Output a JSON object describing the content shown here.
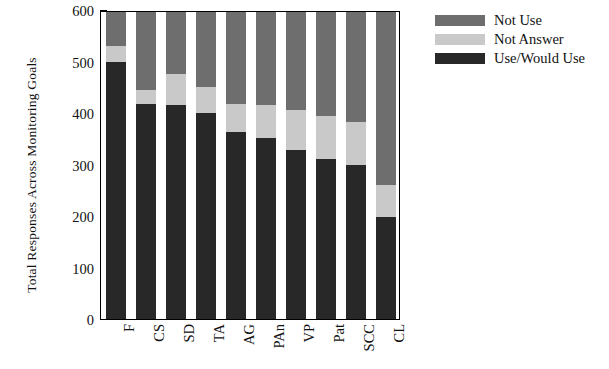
{
  "chart_data": {
    "type": "bar",
    "subtype": "stacked",
    "title": "",
    "xlabel": "",
    "ylabel": "Total Responses Across Monitoring Goals",
    "ylim": [
      0,
      600
    ],
    "yticks": [
      0,
      100,
      200,
      300,
      400,
      500,
      600
    ],
    "ytick_labels": [
      "0",
      "100",
      "200",
      "300",
      "400",
      "500",
      "600"
    ],
    "grid": false,
    "legend_position": "top-right",
    "categories": [
      "F",
      "CS",
      "SD",
      "TA",
      "AG",
      "PAn",
      "VP",
      "Pat",
      "SCC",
      "CL"
    ],
    "series": [
      {
        "name": "Use/Would Use",
        "color": "#282828",
        "values": [
          503,
          420,
          418,
          403,
          365,
          353,
          330,
          313,
          300,
          200
        ]
      },
      {
        "name": "Not Answer",
        "color": "#c9c9c9",
        "values": [
          30,
          27,
          60,
          50,
          55,
          65,
          78,
          84,
          85,
          62
        ]
      },
      {
        "name": "Not Use",
        "color": "#6e6e6e",
        "values": [
          67,
          153,
          122,
          147,
          180,
          182,
          192,
          203,
          215,
          338
        ]
      }
    ],
    "stack_order_bottom_to_top": [
      "Use/Would Use",
      "Not Answer",
      "Not Use"
    ],
    "stack_totals": [
      600,
      600,
      600,
      600,
      600,
      600,
      600,
      600,
      600,
      600
    ]
  },
  "legend": {
    "entries": [
      {
        "label": "Not Use",
        "swatch": "not-use-swatch"
      },
      {
        "label": "Not Answer",
        "swatch": "not-answer-swatch"
      },
      {
        "label": "Use/Would Use",
        "swatch": "use-would-use-swatch"
      }
    ]
  }
}
